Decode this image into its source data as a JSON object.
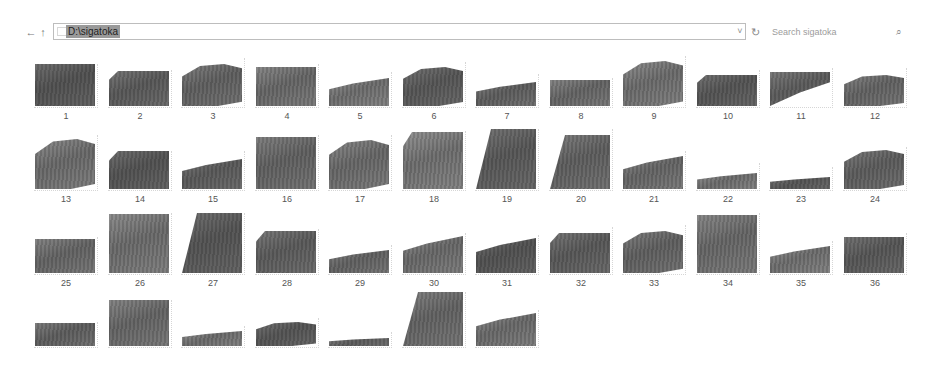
{
  "window": {
    "address_path": "D:\\sigatoka",
    "search_placeholder": "Search sigatoka"
  },
  "nav": {
    "back_icon": "←",
    "up_icon": "↑",
    "dropdown_icon": "˅",
    "refresh_icon": "↻",
    "search_icon": "⌕"
  },
  "items": [
    {
      "label": "1"
    },
    {
      "label": "2"
    },
    {
      "label": "3"
    },
    {
      "label": "4"
    },
    {
      "label": "5"
    },
    {
      "label": "6"
    },
    {
      "label": "7"
    },
    {
      "label": "8"
    },
    {
      "label": "9"
    },
    {
      "label": "10"
    },
    {
      "label": "11"
    },
    {
      "label": "12"
    },
    {
      "label": "13"
    },
    {
      "label": "14"
    },
    {
      "label": "15"
    },
    {
      "label": "16"
    },
    {
      "label": "17"
    },
    {
      "label": "18"
    },
    {
      "label": "19"
    },
    {
      "label": "20"
    },
    {
      "label": "21"
    },
    {
      "label": "22"
    },
    {
      "label": "23"
    },
    {
      "label": "24"
    },
    {
      "label": "25"
    },
    {
      "label": "26"
    },
    {
      "label": "27"
    },
    {
      "label": "28"
    },
    {
      "label": "29"
    },
    {
      "label": "30"
    },
    {
      "label": "31"
    },
    {
      "label": "32"
    },
    {
      "label": "33"
    },
    {
      "label": "34"
    },
    {
      "label": "35"
    },
    {
      "label": "36"
    },
    {
      "label": ""
    },
    {
      "label": ""
    },
    {
      "label": ""
    },
    {
      "label": ""
    },
    {
      "label": ""
    },
    {
      "label": ""
    },
    {
      "label": ""
    }
  ]
}
